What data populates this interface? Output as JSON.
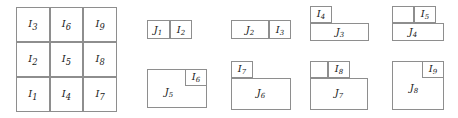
{
  "figure": {
    "kind": "mathematical-diagram",
    "line_color": "#8e8e8e",
    "text_color": "#1a1a1a",
    "background": "#ffffff",
    "width": 458,
    "height": 118
  },
  "grid": {
    "name": "interval-grid",
    "columns": 3,
    "rows": 3,
    "x": 16,
    "y": 7,
    "width": 101,
    "height": 105,
    "cells": [
      {
        "label": "I",
        "index": "3",
        "col": 0,
        "row": 0
      },
      {
        "label": "I",
        "index": "6",
        "col": 1,
        "row": 0
      },
      {
        "label": "I",
        "index": "9",
        "col": 2,
        "row": 0
      },
      {
        "label": "I",
        "index": "2",
        "col": 0,
        "row": 1
      },
      {
        "label": "I",
        "index": "5",
        "col": 1,
        "row": 1
      },
      {
        "label": "I",
        "index": "8",
        "col": 2,
        "row": 1
      },
      {
        "label": "I",
        "index": "1",
        "col": 0,
        "row": 2
      },
      {
        "label": "I",
        "index": "4",
        "col": 1,
        "row": 2
      },
      {
        "label": "I",
        "index": "7",
        "col": 2,
        "row": 2
      }
    ]
  },
  "panels": [
    {
      "name": "panel-j1",
      "j_label": "J",
      "j_index": "1",
      "i_label": "I",
      "i_index": "2",
      "boxes": [
        {
          "name": "j1-box",
          "x": 147,
          "y": 20,
          "w": 23,
          "h": 19
        },
        {
          "name": "i2-box",
          "x": 170,
          "y": 20,
          "w": 22,
          "h": 19
        }
      ],
      "labels": [
        {
          "name": "j1-label",
          "text": "J",
          "sub": "1",
          "x": 158,
          "y": 30
        },
        {
          "name": "i2-label",
          "text": "I",
          "sub": "2",
          "x": 181,
          "y": 30
        }
      ]
    },
    {
      "name": "panel-j2",
      "j_label": "J",
      "j_index": "2",
      "i_label": "I",
      "i_index": "3",
      "boxes": [
        {
          "name": "j2-box",
          "x": 231,
          "y": 20,
          "w": 38,
          "h": 19
        },
        {
          "name": "i3-box",
          "x": 269,
          "y": 20,
          "w": 22,
          "h": 19
        }
      ],
      "labels": [
        {
          "name": "j2-label",
          "text": "J",
          "sub": "2",
          "x": 250,
          "y": 30
        },
        {
          "name": "i3-label",
          "text": "I",
          "sub": "3",
          "x": 280,
          "y": 30
        }
      ]
    },
    {
      "name": "panel-j3",
      "j_label": "J",
      "j_index": "3",
      "i_label": "I",
      "i_index": "4",
      "boxes": [
        {
          "name": "i4-box",
          "x": 310,
          "y": 6,
          "w": 22,
          "h": 17
        },
        {
          "name": "j3-box",
          "x": 310,
          "y": 23,
          "w": 59,
          "h": 18
        }
      ],
      "labels": [
        {
          "name": "i4-label",
          "text": "I",
          "sub": "4",
          "x": 321,
          "y": 14
        },
        {
          "name": "j3-label",
          "text": "J",
          "sub": "3",
          "x": 340,
          "y": 32
        }
      ]
    },
    {
      "name": "panel-j4",
      "j_label": "J",
      "j_index": "4",
      "i_label": "I",
      "i_index": "5",
      "boxes": [
        {
          "name": "i5-box",
          "x": 414,
          "y": 6,
          "w": 22,
          "h": 17
        },
        {
          "name": "j4-box",
          "x": 392,
          "y": 23,
          "w": 52,
          "h": 18
        },
        {
          "name": "j4-upper-left",
          "x": 392,
          "y": 6,
          "w": 22,
          "h": 17
        }
      ],
      "labels": [
        {
          "name": "i5-label",
          "text": "I",
          "sub": "5",
          "x": 425,
          "y": 14
        },
        {
          "name": "j4-label",
          "text": "J",
          "sub": "4",
          "x": 413,
          "y": 32
        }
      ]
    },
    {
      "name": "panel-j5",
      "j_label": "J",
      "j_index": "5",
      "i_label": "I",
      "i_index": "6",
      "boxes": [
        {
          "name": "j5-box",
          "x": 147,
          "y": 69,
          "w": 60,
          "h": 39
        },
        {
          "name": "i6-box",
          "x": 185,
          "y": 69,
          "w": 22,
          "h": 17
        }
      ],
      "labels": [
        {
          "name": "j5-label",
          "text": "J",
          "sub": "5",
          "x": 169,
          "y": 92
        },
        {
          "name": "i6-label",
          "text": "I",
          "sub": "6",
          "x": 196,
          "y": 77
        }
      ]
    },
    {
      "name": "panel-j6",
      "j_label": "J",
      "j_index": "6",
      "i_label": "I",
      "i_index": "7",
      "boxes": [
        {
          "name": "i7-box",
          "x": 231,
          "y": 61,
          "w": 22,
          "h": 17
        },
        {
          "name": "j6-box",
          "x": 231,
          "y": 78,
          "w": 60,
          "h": 32
        }
      ],
      "labels": [
        {
          "name": "i7-label",
          "text": "I",
          "sub": "7",
          "x": 242,
          "y": 69
        },
        {
          "name": "j6-label",
          "text": "J",
          "sub": "6",
          "x": 261,
          "y": 93
        }
      ]
    },
    {
      "name": "panel-j7",
      "j_label": "J",
      "j_index": "7",
      "i_label": "I",
      "i_index": "8",
      "boxes": [
        {
          "name": "i8-box",
          "x": 328,
          "y": 61,
          "w": 22,
          "h": 17
        },
        {
          "name": "j7-box",
          "x": 310,
          "y": 78,
          "w": 58,
          "h": 32
        },
        {
          "name": "j7-upper-left",
          "x": 310,
          "y": 61,
          "w": 18,
          "h": 17
        }
      ],
      "labels": [
        {
          "name": "i8-label",
          "text": "I",
          "sub": "8",
          "x": 339,
          "y": 69
        },
        {
          "name": "j7-label",
          "text": "J",
          "sub": "7",
          "x": 339,
          "y": 93
        }
      ]
    },
    {
      "name": "panel-j8",
      "j_label": "J",
      "j_index": "8",
      "i_label": "I",
      "i_index": "9",
      "boxes": [
        {
          "name": "j8-box",
          "x": 392,
          "y": 61,
          "w": 52,
          "h": 49
        },
        {
          "name": "i9-box",
          "x": 422,
          "y": 61,
          "w": 22,
          "h": 17
        }
      ],
      "labels": [
        {
          "name": "i9-label",
          "text": "I",
          "sub": "9",
          "x": 433,
          "y": 69
        },
        {
          "name": "j8-label",
          "text": "J",
          "sub": "8",
          "x": 414,
          "y": 88
        }
      ]
    }
  ]
}
